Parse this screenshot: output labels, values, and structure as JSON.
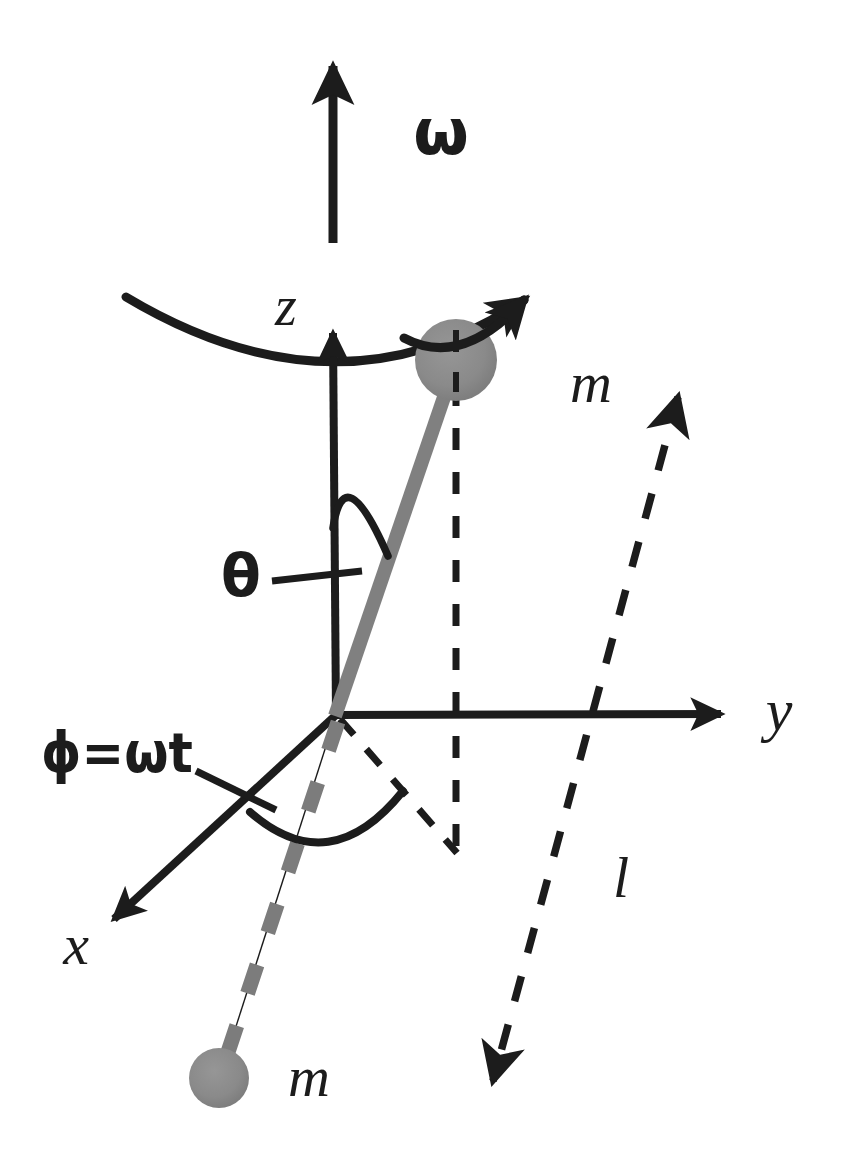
{
  "figure": {
    "background_color": "#ffffff",
    "ink_color": "#1c1c1c",
    "mass_color": "#8a8a8a",
    "rod_color": "#808080",
    "width": 846,
    "height": 1159
  },
  "labels": {
    "omega_top": "ω",
    "z_axis": "z",
    "y_axis": "y",
    "x_axis": "x",
    "theta": "θ",
    "phi_equals_omega_t": "ϕ=ωt",
    "mass_upper": "m",
    "mass_lower": "m",
    "length_l": "l"
  },
  "elements": {
    "omega_arrow": {
      "name": "angular-velocity-vector",
      "x": 333,
      "y_tail": 243,
      "y_head": 62
    },
    "rotation_arc": {
      "name": "rotation-direction-arc",
      "start": [
        125,
        297
      ],
      "end": [
        543,
        290
      ]
    },
    "z_axis": {
      "name": "z-axis",
      "origin": [
        336,
        715
      ],
      "head": [
        333,
        325
      ]
    },
    "y_axis": {
      "name": "y-axis",
      "origin": [
        336,
        715
      ],
      "head": [
        733,
        714
      ]
    },
    "x_axis": {
      "name": "x-axis",
      "origin": [
        336,
        715
      ],
      "head": [
        104,
        928
      ]
    },
    "rod_upper": {
      "name": "pendulum-rod-upper",
      "from": [
        336,
        715
      ],
      "to": [
        456,
        360
      ]
    },
    "rod_lower": {
      "name": "pendulum-rod-lower-dashed",
      "from": [
        336,
        715
      ],
      "to": [
        222,
        1070
      ]
    },
    "mass_upper": {
      "name": "mass-sphere-upper",
      "center": [
        456,
        360
      ],
      "radius": 41
    },
    "mass_lower": {
      "name": "mass-sphere-lower",
      "center": [
        219,
        1078
      ],
      "radius": 30
    },
    "vertical_drop_dashed": {
      "name": "vertical-projection-dashed",
      "from": [
        456,
        380
      ],
      "to": [
        456,
        855
      ]
    },
    "horizontal_projection_dashed": {
      "name": "horizontal-projection-dashed",
      "from": [
        340,
        718
      ],
      "to": [
        456,
        852
      ]
    },
    "length_indicator": {
      "name": "length-l-dashed-arrow",
      "from": [
        683,
        383
      ],
      "to": [
        489,
        1094
      ]
    },
    "theta_arc": {
      "name": "theta-angle-arc",
      "from": [
        333,
        527
      ],
      "to": [
        386,
        556
      ]
    },
    "theta_leader": {
      "name": "theta-leader-line",
      "from": [
        272,
        580
      ],
      "to": [
        360,
        571
      ]
    },
    "phi_arc": {
      "name": "phi-angle-arc",
      "from": [
        251,
        812
      ],
      "to": [
        401,
        789
      ]
    },
    "phi_leader": {
      "name": "phi-leader-line",
      "from": [
        196,
        772
      ],
      "to": [
        274,
        808
      ]
    }
  },
  "label_positions": {
    "omega_top": [
      441,
      136
    ],
    "z_axis": [
      286,
      312
    ],
    "y_axis": [
      779,
      718
    ],
    "x_axis": [
      76,
      951
    ],
    "theta": [
      241,
      580
    ],
    "phi_equals_omega_t": [
      117,
      757
    ],
    "mass_upper": [
      591,
      389
    ],
    "mass_lower": [
      309,
      1083
    ],
    "length_l": [
      621,
      884
    ]
  }
}
